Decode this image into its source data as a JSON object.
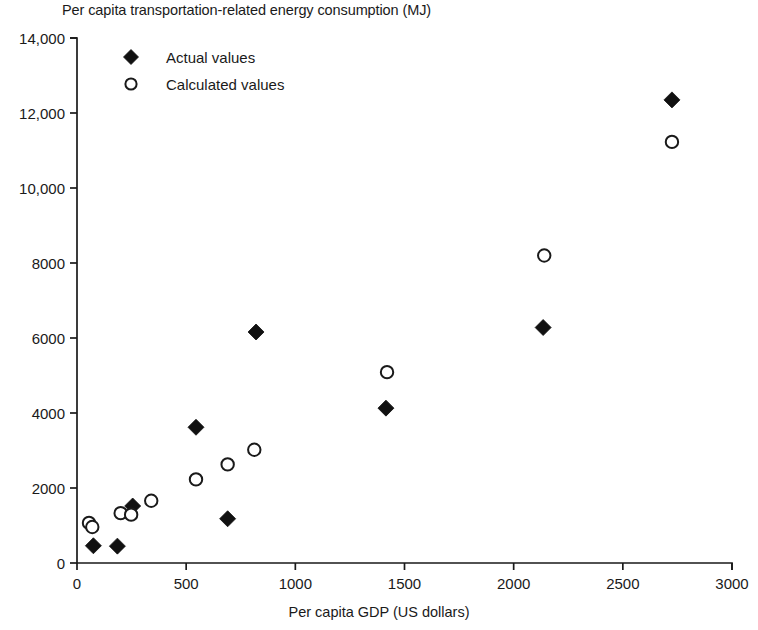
{
  "chart_data": {
    "type": "scatter",
    "title": "Per capita transportation-related energy consumption (MJ)",
    "xlabel": "Per capita GDP (US dollars)",
    "ylabel": "Per capita transportation-related energy consumption (MJ)",
    "xlim": [
      0,
      3000
    ],
    "ylim": [
      0,
      14000
    ],
    "xticks": [
      0,
      500,
      1000,
      1500,
      2000,
      2500,
      3000
    ],
    "xticklabels": [
      "0",
      "500",
      "1000",
      "1500",
      "2000",
      "2500",
      "3000"
    ],
    "yticks": [
      0,
      2000,
      4000,
      6000,
      8000,
      10000,
      12000,
      14000
    ],
    "yticklabels": [
      "0",
      "2000",
      "4000",
      "6000",
      "8000",
      "10,000",
      "12,000",
      "14,000"
    ],
    "grid": false,
    "legend_position": "top-left",
    "series": [
      {
        "name": "Actual values",
        "marker": "filled-diamond",
        "color": "#111111",
        "points": [
          {
            "x": 75,
            "y": 460
          },
          {
            "x": 185,
            "y": 450
          },
          {
            "x": 255,
            "y": 1520
          },
          {
            "x": 545,
            "y": 3620
          },
          {
            "x": 690,
            "y": 1180
          },
          {
            "x": 820,
            "y": 6160
          },
          {
            "x": 1415,
            "y": 4130
          },
          {
            "x": 2135,
            "y": 6280
          },
          {
            "x": 2725,
            "y": 12350
          }
        ]
      },
      {
        "name": "Calculated values",
        "marker": "open-circle",
        "color": "#1a1a1a",
        "points": [
          {
            "x": 55,
            "y": 1070
          },
          {
            "x": 70,
            "y": 960
          },
          {
            "x": 200,
            "y": 1330
          },
          {
            "x": 248,
            "y": 1290
          },
          {
            "x": 340,
            "y": 1660
          },
          {
            "x": 545,
            "y": 2230
          },
          {
            "x": 690,
            "y": 2630
          },
          {
            "x": 812,
            "y": 3020
          },
          {
            "x": 1420,
            "y": 5090
          },
          {
            "x": 2140,
            "y": 8200
          },
          {
            "x": 2725,
            "y": 11230
          }
        ]
      }
    ],
    "legend": [
      {
        "label": "Actual values",
        "marker": "filled-diamond"
      },
      {
        "label": "Calculated values",
        "marker": "open-circle"
      }
    ]
  }
}
